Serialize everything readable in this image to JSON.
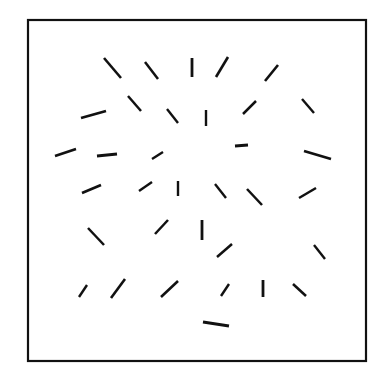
{
  "figure": {
    "title": "",
    "background_color": "#ffffff",
    "canvas": {
      "width": 381,
      "height": 380
    }
  },
  "frame": {
    "name": "bounding-box",
    "x": 28,
    "y": 20,
    "width": 338,
    "height": 341,
    "stroke_color": "#111111",
    "stroke_width": 2.2,
    "fill_color": "#ffffff"
  },
  "chart_data": {
    "type": "scatter",
    "title": "",
    "xlabel": "",
    "ylabel": "",
    "grid": false,
    "legend": null,
    "xlim": [
      28,
      366
    ],
    "ylim": [
      20,
      361
    ],
    "count": 37,
    "stroke_color": "#111111",
    "segments": [
      {
        "id": 1,
        "x1": 104,
        "y1": 58,
        "x2": 121,
        "y2": 78,
        "angle_deg": -49.6,
        "length": 26.2,
        "width": 2.6
      },
      {
        "id": 2,
        "x1": 145,
        "y1": 62,
        "x2": 158,
        "y2": 79,
        "angle_deg": -52.6,
        "length": 21.4,
        "width": 2.5
      },
      {
        "id": 3,
        "x1": 192,
        "y1": 58,
        "x2": 192,
        "y2": 77,
        "angle_deg": -90.0,
        "length": 19.0,
        "width": 2.8
      },
      {
        "id": 4,
        "x1": 216,
        "y1": 77,
        "x2": 228,
        "y2": 57,
        "angle_deg": 59.0,
        "length": 23.3,
        "width": 2.6
      },
      {
        "id": 5,
        "x1": 265,
        "y1": 81,
        "x2": 278,
        "y2": 65,
        "angle_deg": 50.9,
        "length": 20.6,
        "width": 2.6
      },
      {
        "id": 6,
        "x1": 128,
        "y1": 96,
        "x2": 141,
        "y2": 111,
        "angle_deg": -49.1,
        "length": 19.8,
        "width": 2.5
      },
      {
        "id": 7,
        "x1": 167,
        "y1": 109,
        "x2": 178,
        "y2": 123,
        "angle_deg": -51.8,
        "length": 17.8,
        "width": 2.4
      },
      {
        "id": 8,
        "x1": 206,
        "y1": 110,
        "x2": 206,
        "y2": 126,
        "angle_deg": -90.0,
        "length": 16.0,
        "width": 2.4
      },
      {
        "id": 9,
        "x1": 243,
        "y1": 114,
        "x2": 256,
        "y2": 101,
        "angle_deg": 45.0,
        "length": 18.4,
        "width": 2.5
      },
      {
        "id": 10,
        "x1": 302,
        "y1": 99,
        "x2": 314,
        "y2": 113,
        "angle_deg": -49.4,
        "length": 18.4,
        "width": 2.4
      },
      {
        "id": 11,
        "x1": 81,
        "y1": 118,
        "x2": 106,
        "y2": 111,
        "angle_deg": 15.6,
        "length": 26.0,
        "width": 2.8
      },
      {
        "id": 12,
        "x1": 55,
        "y1": 156,
        "x2": 76,
        "y2": 149,
        "angle_deg": 18.4,
        "length": 22.1,
        "width": 2.6
      },
      {
        "id": 13,
        "x1": 97,
        "y1": 156,
        "x2": 117,
        "y2": 154,
        "angle_deg": 5.7,
        "length": 20.1,
        "width": 2.8
      },
      {
        "id": 14,
        "x1": 152,
        "y1": 159,
        "x2": 163,
        "y2": 152,
        "angle_deg": 32.5,
        "length": 13.0,
        "width": 2.4
      },
      {
        "id": 15,
        "x1": 235,
        "y1": 146,
        "x2": 248,
        "y2": 145,
        "angle_deg": 4.4,
        "length": 13.0,
        "width": 2.8
      },
      {
        "id": 16,
        "x1": 304,
        "y1": 151,
        "x2": 331,
        "y2": 159,
        "angle_deg": -16.5,
        "length": 28.2,
        "width": 2.8
      },
      {
        "id": 17,
        "x1": 82,
        "y1": 193,
        "x2": 101,
        "y2": 185,
        "angle_deg": 22.8,
        "length": 20.6,
        "width": 2.6
      },
      {
        "id": 18,
        "x1": 139,
        "y1": 191,
        "x2": 152,
        "y2": 182,
        "angle_deg": 34.7,
        "length": 15.8,
        "width": 2.4
      },
      {
        "id": 19,
        "x1": 178,
        "y1": 181,
        "x2": 178,
        "y2": 196,
        "angle_deg": -90.0,
        "length": 15.0,
        "width": 2.4
      },
      {
        "id": 20,
        "x1": 215,
        "y1": 184,
        "x2": 226,
        "y2": 198,
        "angle_deg": -51.8,
        "length": 17.8,
        "width": 2.4
      },
      {
        "id": 21,
        "x1": 247,
        "y1": 189,
        "x2": 262,
        "y2": 205,
        "angle_deg": -46.8,
        "length": 21.9,
        "width": 2.5
      },
      {
        "id": 22,
        "x1": 299,
        "y1": 198,
        "x2": 316,
        "y2": 188,
        "angle_deg": 30.5,
        "length": 19.7,
        "width": 2.5
      },
      {
        "id": 23,
        "x1": 88,
        "y1": 228,
        "x2": 104,
        "y2": 245,
        "angle_deg": -46.7,
        "length": 23.3,
        "width": 2.5
      },
      {
        "id": 24,
        "x1": 155,
        "y1": 234,
        "x2": 168,
        "y2": 220,
        "angle_deg": 47.1,
        "length": 19.1,
        "width": 2.5
      },
      {
        "id": 25,
        "x1": 202,
        "y1": 220,
        "x2": 202,
        "y2": 240,
        "angle_deg": -90.0,
        "length": 20.0,
        "width": 2.8
      },
      {
        "id": 26,
        "x1": 217,
        "y1": 257,
        "x2": 232,
        "y2": 244,
        "angle_deg": 40.9,
        "length": 19.8,
        "width": 2.5
      },
      {
        "id": 27,
        "x1": 314,
        "y1": 245,
        "x2": 325,
        "y2": 259,
        "angle_deg": -51.8,
        "length": 17.8,
        "width": 2.4
      },
      {
        "id": 28,
        "x1": 79,
        "y1": 297,
        "x2": 87,
        "y2": 285,
        "angle_deg": 56.3,
        "length": 14.4,
        "width": 2.4
      },
      {
        "id": 29,
        "x1": 111,
        "y1": 298,
        "x2": 125,
        "y2": 279,
        "angle_deg": 53.6,
        "length": 23.6,
        "width": 2.6
      },
      {
        "id": 30,
        "x1": 161,
        "y1": 297,
        "x2": 178,
        "y2": 281,
        "angle_deg": 43.3,
        "length": 23.3,
        "width": 2.6
      },
      {
        "id": 31,
        "x1": 221,
        "y1": 296,
        "x2": 229,
        "y2": 284,
        "angle_deg": 56.3,
        "length": 14.4,
        "width": 2.4
      },
      {
        "id": 32,
        "x1": 263,
        "y1": 280,
        "x2": 263,
        "y2": 297,
        "angle_deg": -90.0,
        "length": 17.0,
        "width": 2.8
      },
      {
        "id": 33,
        "x1": 293,
        "y1": 284,
        "x2": 306,
        "y2": 296,
        "angle_deg": -42.7,
        "length": 17.7,
        "width": 2.5
      },
      {
        "id": 34,
        "x1": 203,
        "y1": 322,
        "x2": 229,
        "y2": 326,
        "angle_deg": -8.7,
        "length": 26.3,
        "width": 3.0
      },
      {
        "id": 35,
        "x1": 303,
        "y1": 156,
        "x2": 331,
        "y2": 160,
        "angle_deg": -8.1,
        "length": 28.3,
        "width": 0.0
      },
      {
        "id": 36,
        "x1": 125,
        "y1": 97,
        "x2": 140,
        "y2": 112,
        "angle_deg": -45.0,
        "length": 21.2,
        "width": 0.0
      },
      {
        "id": 37,
        "x1": 165,
        "y1": 110,
        "x2": 177,
        "y2": 124,
        "angle_deg": -49.4,
        "length": 18.4,
        "width": 0.0
      }
    ]
  }
}
